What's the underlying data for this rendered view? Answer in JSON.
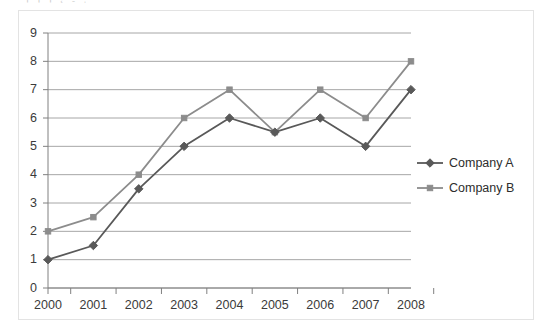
{
  "top_clipped_text": "¡ ¡  ¡      ˛     ˍ    ˌ",
  "chart_data": {
    "type": "line",
    "title": "",
    "subtitle": "",
    "xlabel": "",
    "ylabel": "",
    "categories": [
      "2000",
      "2001",
      "2002",
      "2003",
      "2004",
      "2005",
      "2006",
      "2007",
      "2008"
    ],
    "series": [
      {
        "name": "Company A",
        "marker": "diamond",
        "color": "#595959",
        "values": [
          1,
          1.5,
          3.5,
          5,
          6,
          5.5,
          6,
          5,
          7
        ]
      },
      {
        "name": "Company B",
        "marker": "square",
        "color": "#8c8c8c",
        "values": [
          2,
          2.5,
          4,
          6,
          7,
          5.5,
          7,
          6,
          8
        ]
      }
    ],
    "ylim": [
      0,
      9
    ],
    "ytick_values": [
      0,
      1,
      2,
      3,
      4,
      5,
      6,
      7,
      8,
      9
    ],
    "ytick_labels": [
      "0",
      "1",
      "2",
      "3",
      "4",
      "5",
      "6",
      "7",
      "8",
      "9"
    ],
    "grid": {
      "horizontal": true,
      "vertical": false,
      "color": "#a6a6a6"
    },
    "legend": {
      "position": "right",
      "entries": [
        "Company A",
        "Company B"
      ]
    },
    "axis_color": "#808080",
    "plot_background": "#ffffff",
    "frame_color": "#e3e3e3"
  }
}
